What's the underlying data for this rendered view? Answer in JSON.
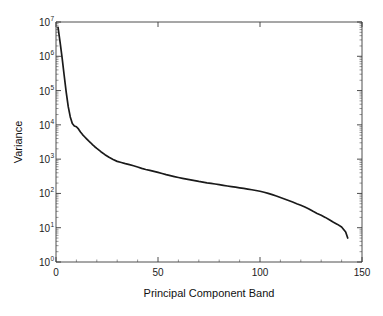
{
  "chart_data": {
    "type": "line",
    "title": "",
    "xlabel": "Principal Component Band",
    "ylabel": "Variance",
    "yscale": "log",
    "xscale": "linear",
    "xlim": [
      0,
      150
    ],
    "ylim": [
      1,
      10000000
    ],
    "grid": false,
    "legend": null,
    "xticks": [
      0,
      50,
      100,
      150
    ],
    "xtick_labels": [
      "0",
      "50",
      "100",
      "150"
    ],
    "yticks": [
      1,
      10,
      100,
      1000,
      10000,
      100000,
      1000000,
      10000000
    ],
    "ytick_labels": [
      "10^0",
      "10^1",
      "10^2",
      "10^3",
      "10^4",
      "10^5",
      "10^6",
      "10^7"
    ],
    "ytick_mantissa": "10",
    "ytick_exponents": [
      "0",
      "1",
      "2",
      "3",
      "4",
      "5",
      "6",
      "7"
    ],
    "series": [
      {
        "name": "variance",
        "color": "#1a1a1a",
        "x": [
          1,
          2,
          3,
          4,
          5,
          6,
          7,
          8,
          9,
          10,
          11,
          12,
          13,
          14,
          15,
          16,
          17,
          18,
          19,
          20,
          22,
          24,
          26,
          28,
          30,
          32,
          34,
          36,
          38,
          40,
          42,
          44,
          46,
          48,
          50,
          52,
          54,
          56,
          58,
          60,
          62,
          64,
          66,
          68,
          70,
          72,
          74,
          76,
          78,
          80,
          82,
          84,
          86,
          88,
          90,
          92,
          94,
          96,
          98,
          100,
          102,
          104,
          106,
          108,
          110,
          112,
          114,
          116,
          118,
          120,
          122,
          124,
          126,
          128,
          130,
          132,
          134,
          136,
          138,
          140,
          142,
          143
        ],
        "y": [
          7000000,
          2600000,
          900000,
          280000,
          90000,
          34000,
          17000,
          11000,
          9300,
          8800,
          7600,
          6200,
          5200,
          4500,
          3900,
          3400,
          3000,
          2600,
          2300,
          2050,
          1650,
          1350,
          1130,
          980,
          860,
          800,
          740,
          690,
          640,
          590,
          540,
          500,
          470,
          440,
          410,
          380,
          352,
          330,
          310,
          292,
          276,
          262,
          248,
          236,
          224,
          214,
          204,
          196,
          188,
          180,
          172,
          165,
          158,
          152,
          146,
          140,
          134,
          128,
          122,
          116,
          108,
          100,
          92,
          84,
          76,
          69,
          62,
          56,
          50,
          45,
          40,
          35,
          30,
          26,
          23,
          20,
          17,
          14.5,
          12.5,
          10.5,
          7.5,
          5.0
        ]
      }
    ]
  },
  "axis_titles": {
    "x": "Principal Component Band",
    "y": "Variance"
  }
}
